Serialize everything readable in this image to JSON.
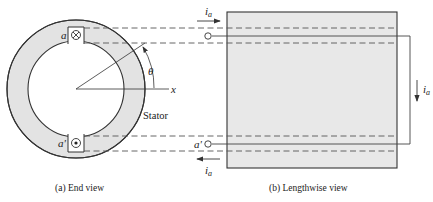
{
  "end_view": {
    "caption": "(a) End view",
    "slot_top_label": "a",
    "slot_bottom_label": "a'",
    "slot_top_symbol": "cross (current into page)",
    "slot_bottom_symbol": "dot (current out of page)",
    "angle_label": "θ",
    "axis_label": "x",
    "stator_label": "Stator"
  },
  "lengthwise_view": {
    "caption": "(b) Lengthwise view",
    "top_terminal_label": "",
    "bottom_terminal_label": "a'",
    "current_top_label": "i",
    "current_top_sub": "a",
    "current_right_label": "i",
    "current_right_sub": "a",
    "current_bottom_label": "i",
    "current_bottom_sub": "a"
  },
  "colors": {
    "stator_fill": "#e3e3e3",
    "rotor_fill": "#ececec",
    "line": "#333333",
    "dash": "#555555",
    "background": "#ffffff"
  }
}
